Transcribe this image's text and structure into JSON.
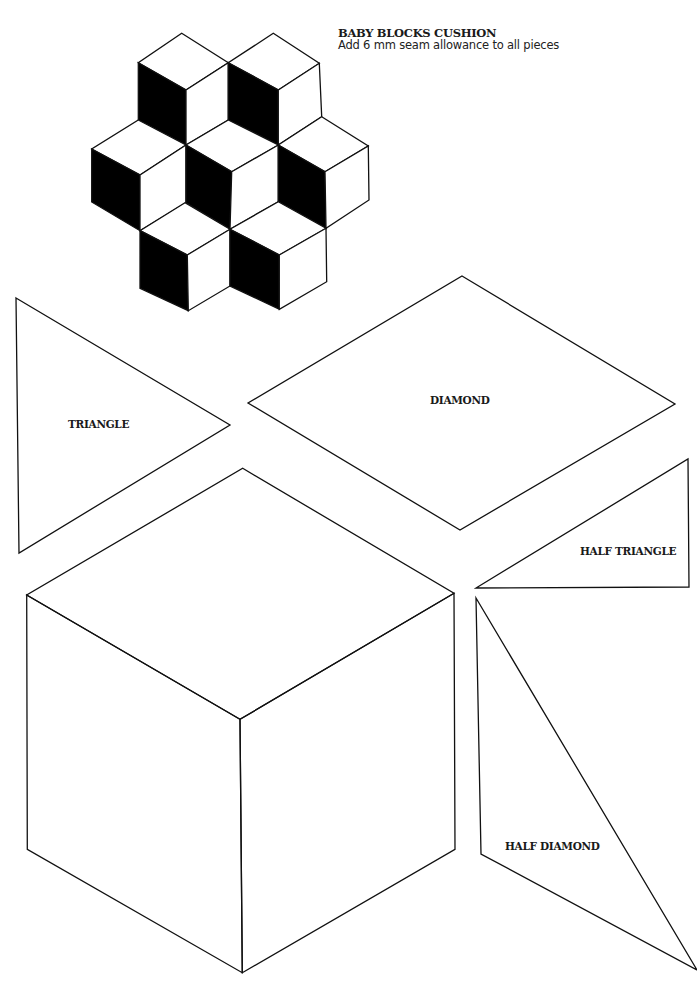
{
  "header": {
    "title": "BABY BLOCKS CUSHION",
    "subtitle": "Add 6 mm seam allowance to all pieces"
  },
  "colors": {
    "line": "#111111",
    "fill_dark": "#000000",
    "background": "#ffffff"
  },
  "illustration": {
    "name": "baby-blocks-arrangement",
    "cube_count": 7
  },
  "templates": [
    {
      "id": "triangle",
      "label": "TRIANGLE"
    },
    {
      "id": "diamond",
      "label": "DIAMOND"
    },
    {
      "id": "half_triangle",
      "label": "HALF TRIANGLE"
    },
    {
      "id": "half_diamond",
      "label": "HALF DIAMOND"
    },
    {
      "id": "block_guide",
      "label": ""
    }
  ]
}
